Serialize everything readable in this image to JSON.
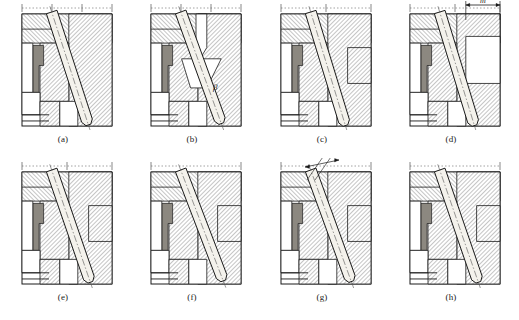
{
  "figure": {
    "panel_count": 8,
    "rows": 2,
    "columns": 4,
    "drawing_type": "engineering-cross-section",
    "colors": {
      "line": "#1a1a1a",
      "hatch": "#2b2b2b",
      "part_fill": "#8c8880",
      "pin_fill": "#f4f2ec",
      "background": "#ffffff",
      "void_fill": "#ffffff",
      "centerline": "#555555"
    }
  },
  "panels": [
    {
      "id": "a",
      "caption": "(a)",
      "x": 18,
      "y": 14,
      "w": 90,
      "h": 112,
      "pin_angle_deg": 18,
      "annotation": null,
      "annotation_symbol": null,
      "has_top_centerline_scale": true,
      "centerline_ticks": 3
    },
    {
      "id": "b",
      "caption": "(b)",
      "x": 147,
      "y": 14,
      "w": 90,
      "h": 112,
      "pin_angle_deg": 20,
      "annotation": "beta",
      "annotation_symbol": "β",
      "annotation_x": 62,
      "annotation_y": 76,
      "has_top_centerline_scale": true,
      "centerline_ticks": 3
    },
    {
      "id": "c",
      "caption": "(c)",
      "x": 277,
      "y": 14,
      "w": 90,
      "h": 112,
      "pin_angle_deg": 17,
      "annotation": null,
      "annotation_symbol": null,
      "has_top_centerline_scale": true,
      "centerline_ticks": 2
    },
    {
      "id": "d",
      "caption": "(d)",
      "x": 406,
      "y": 14,
      "w": 90,
      "h": 112,
      "pin_angle_deg": 17,
      "annotation": "m",
      "annotation_symbol": "m",
      "annotation_type": "linear-dimension",
      "annotation_x": 68,
      "annotation_y": 6,
      "has_top_centerline_scale": true,
      "centerline_ticks": 2
    },
    {
      "id": "e",
      "caption": "(e)",
      "x": 18,
      "y": 172,
      "w": 90,
      "h": 112,
      "pin_angle_deg": 19,
      "annotation": null,
      "annotation_symbol": null,
      "has_top_centerline_scale": true,
      "centerline_ticks": 2
    },
    {
      "id": "f",
      "caption": "(f)",
      "x": 147,
      "y": 172,
      "w": 90,
      "h": 112,
      "pin_angle_deg": 21,
      "annotation": null,
      "annotation_symbol": null,
      "has_top_centerline_scale": true,
      "centerline_ticks": 1
    },
    {
      "id": "g",
      "caption": "(g)",
      "x": 277,
      "y": 172,
      "w": 90,
      "h": 112,
      "pin_angle_deg": 20,
      "annotation": "delta",
      "annotation_symbol": "δ",
      "annotation_type": "angular-dimension",
      "annotation_x": 44,
      "annotation_y": -16,
      "has_top_centerline_scale": true,
      "centerline_ticks": 1
    },
    {
      "id": "h",
      "caption": "(h)",
      "x": 406,
      "y": 172,
      "w": 90,
      "h": 112,
      "pin_angle_deg": 19,
      "annotation": null,
      "annotation_symbol": null,
      "has_top_centerline_scale": true,
      "centerline_ticks": 1
    }
  ],
  "captions": {
    "a": "(a)",
    "b": "(b)",
    "c": "(c)",
    "d": "(d)",
    "e": "(e)",
    "f": "(f)",
    "g": "(g)",
    "h": "(h)"
  },
  "symbols": {
    "beta": "β",
    "delta": "δ",
    "m": "m"
  }
}
